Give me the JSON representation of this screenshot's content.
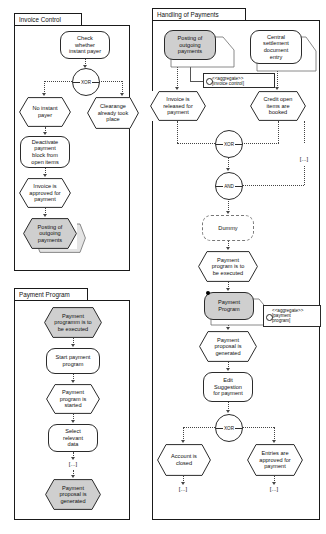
{
  "diagram": {
    "packages": [
      {
        "id": "invoice-control",
        "label": "Invoice Control"
      },
      {
        "id": "payment-program",
        "label": "Payment Program"
      },
      {
        "id": "handling-of-payments",
        "label": "Handling of Payments"
      }
    ]
  },
  "invoice_control": {
    "nodes": [
      {
        "id": "check-whether-instant-payer",
        "type": "function",
        "label": "Check\nwhether\ninstant payer"
      },
      {
        "id": "xor-1",
        "type": "connector",
        "label": "XOR"
      },
      {
        "id": "no-instant-payer",
        "type": "event",
        "label": "No instant\npayer"
      },
      {
        "id": "clearance-already-took-place",
        "type": "event",
        "label": "Clearange\nalready took\nplace"
      },
      {
        "id": "deactivate-payment-block",
        "type": "function",
        "label": "Deactivate\npayment\nblock from\nopen items"
      },
      {
        "id": "invoice-approved-for-payment",
        "type": "event",
        "label": "Invoice is\napproved for\npayment"
      },
      {
        "id": "posting-of-outgoing-payments",
        "type": "event-grey",
        "label": "Posting of\noutgoing\npayments"
      }
    ]
  },
  "payment_program": {
    "nodes": [
      {
        "id": "payment-program-to-be-executed",
        "type": "event-grey",
        "label": "Payment\nprogramm is to\nbe executed"
      },
      {
        "id": "start-payment-program",
        "type": "function",
        "label": "Start payment\nprogram"
      },
      {
        "id": "payment-program-is-started",
        "type": "event",
        "label": "Payment\nprogram is\nstarted"
      },
      {
        "id": "select-relevant-data",
        "type": "function",
        "label": "Select\nrelevant\ndata"
      },
      {
        "id": "ellipsis-pp",
        "type": "ellipsis",
        "label": "[...]"
      },
      {
        "id": "payment-proposal-is-generated",
        "type": "event-grey",
        "label": "Payment\nproposal is\ngenerated"
      }
    ]
  },
  "handling_of_payments": {
    "nodes": [
      {
        "id": "posting-of-outgoing-payments-hp",
        "type": "function-grey",
        "label": "Posting of\noutgoing\npayments"
      },
      {
        "id": "central-settlement-document-entry",
        "type": "function",
        "label": "Central\nsettlement\ndocument\nentry"
      },
      {
        "id": "invoice-is-released-for-payment",
        "type": "event",
        "label": "Invoice is\nreleased for\npayment"
      },
      {
        "id": "credit-open-items-are-booked",
        "type": "event",
        "label": "Credit open\nitems are\nbooked"
      },
      {
        "id": "xor-2",
        "type": "connector",
        "label": "XOR"
      },
      {
        "id": "and-1",
        "type": "connector",
        "label": "AND"
      },
      {
        "id": "dummy",
        "type": "function-dashed",
        "label": "Dummy"
      },
      {
        "id": "payment-program-to-be-executed-hp",
        "type": "event",
        "label": "Payment\nprogram is to\nbe executed"
      },
      {
        "id": "payment-program-box",
        "type": "function-grey",
        "label": "Payment\nProgram"
      },
      {
        "id": "payment-proposal-is-generated-hp",
        "type": "event",
        "label": "Payment\nproposal is\ngenerated"
      },
      {
        "id": "edit-suggestion-for-payment",
        "type": "function",
        "label": "Edit\nSuggestion\nfor payment"
      },
      {
        "id": "xor-3",
        "type": "connector",
        "label": "XOR"
      },
      {
        "id": "account-is-closed",
        "type": "event",
        "label": "Account is\nclosed"
      },
      {
        "id": "entries-are-approved-for-payment",
        "type": "event",
        "label": "Entries are\napproved for\npayment"
      }
    ],
    "notes": [
      {
        "id": "note-invoice-control",
        "line1": "<<aggregate>>",
        "line2": "[invoice control]"
      },
      {
        "id": "note-payment-program",
        "line1": "<<aggregate>>",
        "line2": "[payment\nprogram]"
      }
    ],
    "ellipses": [
      {
        "id": "ellipsis-right",
        "label": "[...]"
      },
      {
        "id": "ellipsis-left-bottom",
        "label": "[...]"
      },
      {
        "id": "ellipsis-right-bottom",
        "label": "[...]"
      }
    ]
  },
  "colors": {
    "grey_fill": "#cfcfcf",
    "stroke": "#2b2b2b",
    "dotted": "#444444",
    "background": "#ffffff"
  }
}
